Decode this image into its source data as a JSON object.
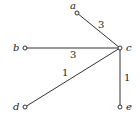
{
  "graph": {
    "nodes": [
      {
        "id": "a",
        "label": "a",
        "x": 77,
        "y": 13,
        "lx": 71,
        "ly": 10
      },
      {
        "id": "b",
        "label": "b",
        "x": 25,
        "y": 48,
        "lx": 13,
        "ly": 51
      },
      {
        "id": "c",
        "label": "c",
        "x": 120,
        "y": 48,
        "lx": 127,
        "ly": 51
      },
      {
        "id": "d",
        "label": "d",
        "x": 25,
        "y": 107,
        "lx": 13,
        "ly": 110
      },
      {
        "id": "e",
        "label": "e",
        "x": 120,
        "y": 107,
        "lx": 127,
        "ly": 110
      }
    ],
    "edges": [
      {
        "from": "a",
        "to": "c",
        "weight": "3",
        "wx": 98,
        "wy": 28
      },
      {
        "from": "b",
        "to": "c",
        "weight": "3",
        "wx": 72,
        "wy": 58
      },
      {
        "from": "d",
        "to": "c",
        "weight": "1",
        "wx": 63,
        "wy": 76
      },
      {
        "from": "c",
        "to": "e",
        "weight": "1",
        "wx": 125,
        "wy": 80
      }
    ]
  }
}
